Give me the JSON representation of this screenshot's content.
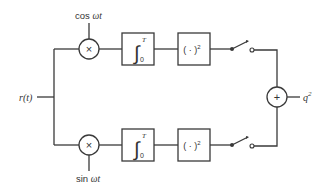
{
  "diagram": {
    "type": "block-diagram",
    "input": {
      "label": "r(t)"
    },
    "output": {
      "label": "q",
      "superscript": "2"
    },
    "branches": [
      {
        "name": "in-phase",
        "reference": {
          "func": "cos",
          "arg": "ωt"
        },
        "multiplier_symbol": "×",
        "integrator": {
          "symbol": "∫",
          "upper": "T",
          "lower": "0"
        },
        "squarer": {
          "text": "( · )",
          "superscript": "2"
        },
        "switch": "sampler"
      },
      {
        "name": "quadrature",
        "reference": {
          "func": "sin",
          "arg": "ωt"
        },
        "multiplier_symbol": "×",
        "integrator": {
          "symbol": "∫",
          "upper": "T",
          "lower": "0"
        },
        "squarer": {
          "text": "( · )",
          "superscript": "2"
        },
        "switch": "sampler"
      }
    ],
    "summer_symbol": "+",
    "colors": {
      "line": "#3a3a3a",
      "text": "#333333",
      "background": "#ffffff"
    }
  }
}
